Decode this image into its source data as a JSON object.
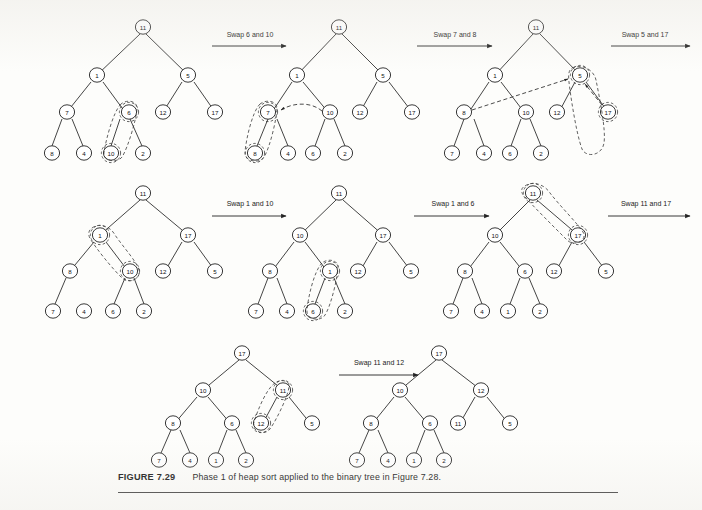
{
  "figure": {
    "label": "FIGURE 7.29",
    "caption": "Phase 1 of heap sort applied to the binary tree in Figure 7.28.",
    "rows": 3,
    "tree_count": 8,
    "arrow_count": 7
  },
  "arrows": [
    {
      "id": "arrow-1",
      "label": "Swap 6 and 10",
      "row": 1
    },
    {
      "id": "arrow-2",
      "label": "Swap 7 and 8",
      "row": 1
    },
    {
      "id": "arrow-3",
      "label": "Swap 5 and 17",
      "row": 1
    },
    {
      "id": "arrow-4",
      "label": "Swap 1 and 10",
      "row": 2
    },
    {
      "id": "arrow-5",
      "label": "Swap 1 and 6",
      "row": 2
    },
    {
      "id": "arrow-6",
      "label": "Swap 11 and 17",
      "row": 2
    },
    {
      "id": "arrow-7",
      "label": "Swap 11 and 12",
      "row": 3
    }
  ],
  "trees": [
    {
      "id": "tree-1",
      "row": 1,
      "step": 1,
      "nodes": [
        "11",
        "1",
        "5",
        "7",
        "6",
        "12",
        "17",
        "8",
        "4",
        "10",
        "2"
      ],
      "highlight": [
        "6",
        "10"
      ]
    },
    {
      "id": "tree-2",
      "row": 1,
      "step": 2,
      "nodes": [
        "11",
        "1",
        "5",
        "7",
        "10",
        "12",
        "17",
        "8",
        "4",
        "6",
        "2"
      ],
      "highlight": [
        "7",
        "8"
      ]
    },
    {
      "id": "tree-3",
      "row": 1,
      "step": 3,
      "nodes": [
        "11",
        "1",
        "5",
        "8",
        "10",
        "12",
        "17",
        "7",
        "4",
        "6",
        "2"
      ],
      "highlight": [
        "5",
        "17"
      ]
    },
    {
      "id": "tree-4",
      "row": 2,
      "step": 4,
      "nodes": [
        "11",
        "1",
        "17",
        "8",
        "10",
        "12",
        "5",
        "7",
        "4",
        "6",
        "2"
      ],
      "highlight": [
        "1",
        "10"
      ]
    },
    {
      "id": "tree-5",
      "row": 2,
      "step": 5,
      "nodes": [
        "11",
        "10",
        "17",
        "8",
        "1",
        "12",
        "5",
        "7",
        "4",
        "6",
        "2"
      ],
      "highlight": [
        "1",
        "6"
      ]
    },
    {
      "id": "tree-6",
      "row": 2,
      "step": 6,
      "nodes": [
        "11",
        "10",
        "17",
        "8",
        "6",
        "12",
        "5",
        "7",
        "4",
        "1",
        "2"
      ],
      "highlight": [
        "11",
        "17"
      ]
    },
    {
      "id": "tree-7",
      "row": 3,
      "step": 7,
      "nodes": [
        "17",
        "10",
        "11",
        "8",
        "6",
        "12",
        "5",
        "7",
        "4",
        "1",
        "2"
      ],
      "highlight": [
        "11",
        "12"
      ]
    },
    {
      "id": "tree-8",
      "row": 3,
      "step": 8,
      "nodes": [
        "17",
        "10",
        "12",
        "8",
        "6",
        "11",
        "5",
        "7",
        "4",
        "1",
        "2"
      ],
      "highlight": []
    }
  ],
  "node_values": {
    "t1": {
      "root": "11",
      "l": "1",
      "r": "5",
      "ll": "7",
      "lr": "6",
      "rl": "12",
      "rr": "17",
      "lll": "8",
      "llr": "4",
      "lrl": "10",
      "lrr": "2"
    },
    "t2": {
      "root": "11",
      "l": "1",
      "r": "5",
      "ll": "7",
      "lr": "10",
      "rl": "12",
      "rr": "17",
      "lll": "8",
      "llr": "4",
      "lrl": "6",
      "lrr": "2"
    },
    "t3": {
      "root": "11",
      "l": "1",
      "r": "5",
      "ll": "8",
      "lr": "10",
      "rl": "12",
      "rr": "17",
      "lll": "7",
      "llr": "4",
      "lrl": "6",
      "lrr": "2"
    },
    "t4": {
      "root": "11",
      "l": "1",
      "r": "17",
      "ll": "8",
      "lr": "10",
      "rl": "12",
      "rr": "5",
      "lll": "7",
      "llr": "4",
      "lrl": "6",
      "lrr": "2"
    },
    "t5": {
      "root": "11",
      "l": "10",
      "r": "17",
      "ll": "8",
      "lr": "1",
      "rl": "12",
      "rr": "5",
      "lll": "7",
      "llr": "4",
      "lrl": "6",
      "lrr": "2"
    },
    "t6": {
      "root": "11",
      "l": "10",
      "r": "17",
      "ll": "8",
      "lr": "6",
      "rl": "12",
      "rr": "5",
      "lll": "7",
      "llr": "4",
      "lrl": "1",
      "lrr": "2"
    },
    "t7": {
      "root": "17",
      "l": "10",
      "r": "11",
      "ll": "8",
      "lr": "6",
      "rl": "12",
      "rr": "5",
      "lll": "7",
      "llr": "4",
      "lrl": "1",
      "lrr": "2"
    },
    "t8": {
      "root": "17",
      "l": "10",
      "r": "12",
      "ll": "8",
      "lr": "6",
      "rl": "11",
      "rr": "5",
      "lll": "7",
      "llr": "4",
      "lrl": "1",
      "lrr": "2"
    }
  },
  "colors": {
    "ink": "#232323",
    "paper": "#fdfdfb",
    "highlight_stroke": "#3a3a3a"
  }
}
